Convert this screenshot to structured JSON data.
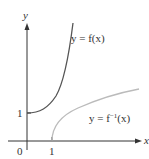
{
  "diagram": {
    "axes": {
      "x_label": "x",
      "y_label": "y",
      "origin_label": "0",
      "x_tick_label": "1",
      "y_tick_label": "1"
    },
    "curves": [
      {
        "name": "f",
        "label": "y = f(x)",
        "color": "#555555",
        "description": "starts at (0,1), increasing convex"
      },
      {
        "name": "f-inverse",
        "label_prefix": "y = f",
        "label_sup": "−1",
        "label_suffix": "(x)",
        "color": "#bbbbbb",
        "description": "starts at (1,0), increasing concave"
      }
    ]
  }
}
